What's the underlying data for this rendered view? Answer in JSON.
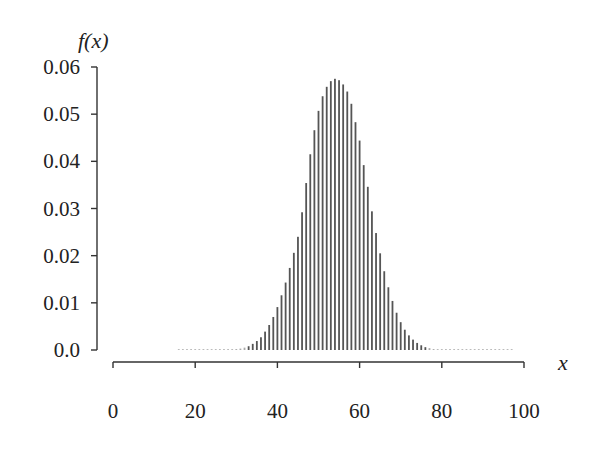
{
  "chart_data": {
    "type": "bar",
    "title": "",
    "xlabel": "x",
    "ylabel": "f(x)",
    "xlim": [
      0,
      100
    ],
    "ylim": [
      0,
      0.06
    ],
    "x_ticks": [
      0,
      20,
      40,
      60,
      80,
      100
    ],
    "x_tick_labels": [
      "0",
      "20",
      "40",
      "60",
      "80",
      "100"
    ],
    "y_ticks": [
      0,
      0.01,
      0.02,
      0.03,
      0.04,
      0.05,
      0.06
    ],
    "y_tick_labels": [
      "0.0",
      "0.01",
      "0.02",
      "0.03",
      "0.04",
      "0.05",
      "0.06"
    ],
    "grid": false,
    "legend": null,
    "x": [
      16,
      17,
      18,
      19,
      20,
      21,
      22,
      23,
      24,
      25,
      26,
      27,
      28,
      29,
      30,
      31,
      32,
      33,
      34,
      35,
      36,
      37,
      38,
      39,
      40,
      41,
      42,
      43,
      44,
      45,
      46,
      47,
      48,
      49,
      50,
      51,
      52,
      53,
      54,
      55,
      56,
      57,
      58,
      59,
      60,
      61,
      62,
      63,
      64,
      65,
      66,
      67,
      68,
      69,
      70,
      71,
      72,
      73,
      74,
      75,
      76,
      77,
      78,
      79,
      80,
      81,
      82,
      83,
      84,
      85,
      86,
      87,
      88,
      89,
      90,
      91,
      92,
      93,
      94,
      95,
      96,
      97
    ],
    "values": [
      0.0,
      0.0,
      0.0,
      0.0,
      0.0,
      0.0,
      0.0,
      0.0,
      0.0,
      0.0,
      0.0,
      0.0001,
      0.0001,
      0.0001,
      0.0002,
      0.0003,
      0.0005,
      0.0008,
      0.0013,
      0.0019,
      0.0027,
      0.0039,
      0.0053,
      0.007,
      0.0091,
      0.0116,
      0.0143,
      0.0174,
      0.0206,
      0.024,
      0.0292,
      0.0354,
      0.0415,
      0.0466,
      0.0507,
      0.0538,
      0.0558,
      0.057,
      0.0575,
      0.0572,
      0.0563,
      0.0548,
      0.0522,
      0.0483,
      0.0444,
      0.0392,
      0.0346,
      0.0294,
      0.0248,
      0.0205,
      0.0167,
      0.0133,
      0.0104,
      0.0079,
      0.0059,
      0.0043,
      0.0031,
      0.0022,
      0.0015,
      0.001,
      0.0006,
      0.0004,
      0.0002,
      0.0001,
      0.0001,
      0.0,
      0.0,
      0.0,
      0.0,
      0.0,
      0.0,
      0.0,
      0.0,
      0.0,
      0.0,
      0.0,
      0.0,
      0.0,
      0.0,
      0.0,
      0.0,
      0.0
    ]
  }
}
